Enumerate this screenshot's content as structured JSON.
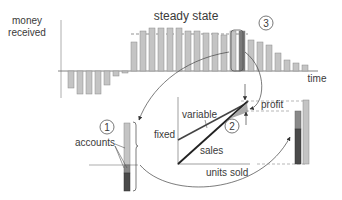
{
  "labels": {
    "y_axis_line1": "money",
    "y_axis_line2": "received",
    "x_axis": "time",
    "steady_state": "steady state",
    "accounts": "accounts",
    "fixed": "fixed",
    "variable": "variable",
    "sales": "sales",
    "profit": "profit",
    "units_sold": "units sold",
    "marker1": "1",
    "marker2": "2",
    "marker3": "3"
  },
  "colors": {
    "bar_fill": "#c4c4c4",
    "bar_stroke": "#8a8a8a",
    "highlight_bar": "#7a7a7a",
    "dark_segment": "#4a4a4a",
    "mid_segment": "#888888",
    "line": "#333333"
  },
  "chart_data": {
    "type": "bar",
    "title": "steady state",
    "xlabel": "time",
    "ylabel": "money received",
    "values": [
      -17,
      -23,
      -23,
      -23,
      -14,
      -5,
      -2,
      29,
      40,
      43,
      43,
      43,
      43,
      40,
      40,
      38,
      38,
      36,
      40,
      40,
      31,
      29,
      26,
      18,
      11,
      8,
      6
    ],
    "highlight_index": 19
  }
}
